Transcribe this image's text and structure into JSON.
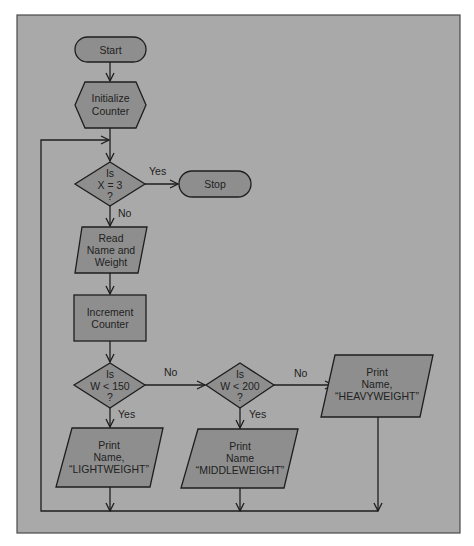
{
  "colors": {
    "page_background": "#ffffff",
    "panel_fill": "#a9a9a9",
    "panel_border": "#4a4a4a",
    "shape_fill": "#8e8e8e",
    "stroke": "#1e1e1e",
    "text": "#222222"
  },
  "nodes": {
    "start": {
      "type": "terminal",
      "lines": [
        "Start"
      ]
    },
    "init": {
      "type": "preparation",
      "lines": [
        "Initialize",
        "Counter"
      ]
    },
    "check_x": {
      "type": "decision",
      "lines": [
        "Is",
        "X = 3",
        "?"
      ]
    },
    "stop": {
      "type": "terminal",
      "lines": [
        "Stop"
      ]
    },
    "read": {
      "type": "input-output",
      "lines": [
        "Read",
        "Name and",
        "Weight"
      ]
    },
    "increment": {
      "type": "process",
      "lines": [
        "Increment",
        "Counter"
      ]
    },
    "check_150": {
      "type": "decision",
      "lines": [
        "Is",
        "W < 150",
        "?"
      ]
    },
    "check_200": {
      "type": "decision",
      "lines": [
        "Is",
        "W < 200",
        "?"
      ]
    },
    "light": {
      "type": "input-output",
      "lines": [
        "Print",
        "Name,",
        "“LIGHTWEIGHT”"
      ]
    },
    "middle": {
      "type": "input-output",
      "lines": [
        "Print",
        "Name",
        "“MIDDLEWEIGHT”"
      ]
    },
    "heavy": {
      "type": "input-output",
      "lines": [
        "Print",
        "Name,",
        "“HEAVYWEIGHT”"
      ]
    }
  },
  "edge_labels": {
    "x_yes": "Yes",
    "x_no": "No",
    "w150_no": "No",
    "w150_yes": "Yes",
    "w200_no": "No",
    "w200_yes": "Yes"
  },
  "edges": [
    {
      "from": "start",
      "to": "init"
    },
    {
      "from": "init",
      "to": "check_x"
    },
    {
      "from": "check_x",
      "to": "stop",
      "label": "Yes"
    },
    {
      "from": "check_x",
      "to": "read",
      "label": "No"
    },
    {
      "from": "read",
      "to": "increment"
    },
    {
      "from": "increment",
      "to": "check_150"
    },
    {
      "from": "check_150",
      "to": "light",
      "label": "Yes"
    },
    {
      "from": "check_150",
      "to": "check_200",
      "label": "No"
    },
    {
      "from": "check_200",
      "to": "middle",
      "label": "Yes"
    },
    {
      "from": "check_200",
      "to": "heavy",
      "label": "No"
    },
    {
      "from": "light",
      "to": "check_x",
      "label": "loop"
    },
    {
      "from": "middle",
      "to": "check_x",
      "label": "loop"
    },
    {
      "from": "heavy",
      "to": "check_x",
      "label": "loop"
    }
  ]
}
